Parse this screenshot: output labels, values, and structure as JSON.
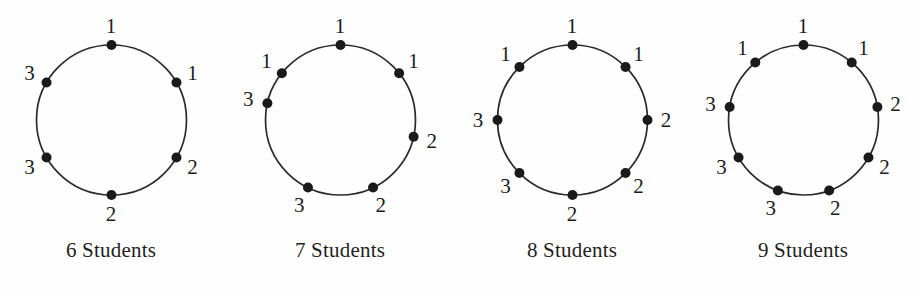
{
  "figure": {
    "background_color": "#fefefe",
    "stroke_color": "#2b2b2b",
    "dot_color": "#1a1a1a",
    "text_color": "#1f1f1f",
    "circle_radius": 75,
    "dot_radius": 5,
    "label_offset": 19,
    "panel_width": 229,
    "center_y": 120
  },
  "chart_data": {
    "type": "diagram",
    "panels": [
      {
        "caption": "6 Students",
        "count": 6,
        "center_x": 111,
        "labels": [
          "1",
          "1",
          "2",
          "2",
          "3",
          "3"
        ],
        "angles_deg": [
          90,
          30,
          -30,
          -90,
          -150,
          150
        ]
      },
      {
        "caption": "7 Students",
        "count": 7,
        "center_x": 340,
        "labels": [
          "1",
          "1",
          "2",
          "2",
          "3",
          "3",
          "1"
        ],
        "angles_deg": [
          90,
          38.571,
          -12.857,
          -64.286,
          -115.714,
          167.143,
          141.429
        ]
      },
      {
        "caption": "8 Students",
        "count": 8,
        "center_x": 572,
        "labels": [
          "1",
          "1",
          "2",
          "2",
          "2",
          "3",
          "3",
          "1"
        ],
        "angles_deg": [
          90,
          45,
          0,
          -45,
          -90,
          -135,
          180,
          135
        ]
      },
      {
        "caption": "9 Students",
        "count": 9,
        "center_x": 803,
        "labels": [
          "1",
          "1",
          "2",
          "2",
          "2",
          "3",
          "3",
          "3",
          "1"
        ],
        "angles_deg": [
          90,
          50,
          10,
          -30,
          -70,
          -110,
          -150,
          170,
          130
        ]
      }
    ]
  }
}
